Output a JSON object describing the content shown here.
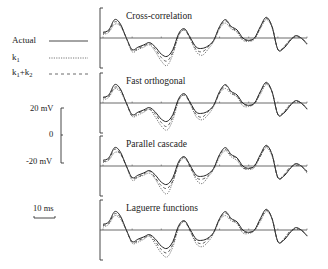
{
  "chart_data": {
    "type": "line",
    "title": "",
    "xlabel": "Time",
    "ylabel": "Membrane potential",
    "legend": {
      "position": "left",
      "entries": [
        {
          "name": "Actual",
          "style": "solid"
        },
        {
          "name": "k1",
          "style": "dotted"
        },
        {
          "name": "k1+k2",
          "style": "dashed"
        }
      ]
    },
    "scale_bars": {
      "voltage": {
        "labels": [
          "20 mV",
          "0",
          "-20 mV"
        ],
        "range_mV": [
          -20,
          20
        ]
      },
      "time": {
        "label": "10 ms",
        "value_ms": 10
      }
    },
    "panels": [
      {
        "title": "Cross-correlation"
      },
      {
        "title": "Fast orthogonal"
      },
      {
        "title": "Parallel cascade"
      },
      {
        "title": "Laguerre functions"
      }
    ],
    "x": [
      0,
      2,
      4,
      6,
      8,
      10,
      12,
      14,
      16,
      18,
      20,
      22,
      24,
      26,
      28,
      30,
      32,
      34,
      36,
      38,
      40,
      42,
      44,
      46,
      48,
      50,
      52,
      54,
      56,
      58,
      60,
      62,
      64,
      66,
      68,
      70
    ],
    "series": [
      {
        "name": "Actual",
        "values": [
          5,
          7,
          16,
          12,
          0,
          -10,
          -8,
          -6,
          -4,
          -8,
          -14,
          -16,
          -10,
          4,
          8,
          0,
          -8,
          -9,
          -7,
          -2,
          10,
          16,
          10,
          7,
          0,
          -2,
          0,
          10,
          18,
          10,
          -10,
          -9,
          -3,
          2,
          0,
          -5
        ]
      },
      {
        "name": "k1",
        "values": [
          3,
          5,
          12,
          10,
          0,
          -12,
          -10,
          -8,
          -6,
          -12,
          -20,
          -24,
          -14,
          2,
          7,
          -1,
          -12,
          -15,
          -10,
          -3,
          8,
          13,
          8,
          5,
          -2,
          -3,
          -1,
          8,
          16,
          9,
          -10,
          -8,
          -2,
          1,
          0,
          -6
        ]
      },
      {
        "name": "k1+k2",
        "values": [
          4,
          6,
          14,
          11,
          0,
          -11,
          -9,
          -7,
          -5,
          -10,
          -17,
          -20,
          -12,
          3,
          7,
          -1,
          -10,
          -12,
          -8,
          -2,
          9,
          15,
          9,
          6,
          -1,
          -2,
          0,
          9,
          17,
          10,
          -10,
          -8,
          -2,
          1,
          0,
          -5
        ]
      }
    ]
  },
  "figure": {
    "legend_labels": {
      "actual": "Actual",
      "k1_base": "k",
      "k1_sub": "1",
      "k1k2_a": "k",
      "k1k2_a_sub": "1",
      "k1k2_plus": "+k",
      "k1k2_b_sub": "2"
    },
    "scale": {
      "top": "20 mV",
      "mid": "0",
      "bottom": "-20 mV",
      "time": "10 ms"
    },
    "panel_titles": [
      "Cross-correlation",
      "Fast orthogonal",
      "Parallel cascade",
      "Laguerre functions"
    ]
  }
}
